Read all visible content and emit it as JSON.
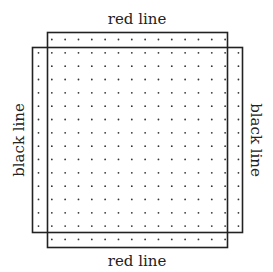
{
  "diagram": {
    "labels": {
      "top": "red line",
      "bottom": "red line",
      "left": "black line",
      "right": "black line"
    },
    "grid": {
      "columns": 16,
      "rows": 16,
      "x0": 38.5,
      "y0": 39.5,
      "spacing": 13.33,
      "dot_color": "#333333",
      "corners_excluded": true
    },
    "red_rect": {
      "x": 47.5,
      "y": 32.5,
      "w": 180,
      "h": 215,
      "stroke": "#222222"
    },
    "black_rect": {
      "x": 32.5,
      "y": 47.5,
      "w": 210,
      "h": 185,
      "stroke": "#222222"
    }
  }
}
